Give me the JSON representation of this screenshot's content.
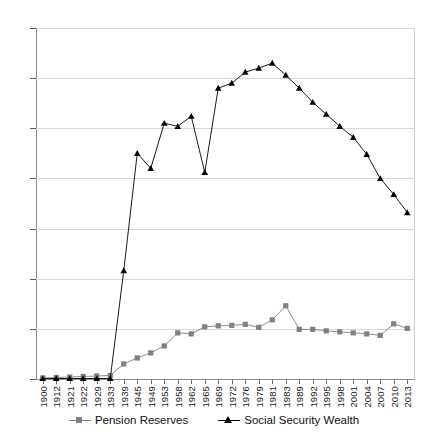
{
  "chart_data": {
    "type": "line",
    "title": "",
    "subtitle": "",
    "xlabel": "",
    "ylabel": "",
    "ylim": [
      0,
      35
    ],
    "yticks": [
      0,
      5,
      10,
      15,
      20,
      25,
      30,
      35
    ],
    "grid": true,
    "legend_position": "bottom",
    "categories": [
      "1900",
      "1912",
      "1921",
      "1922",
      "1929",
      "1933",
      "1939",
      "1945",
      "1949",
      "1953",
      "1958",
      "1962",
      "1965",
      "1969",
      "1972",
      "1976",
      "1979",
      "1981",
      "1983",
      "1989",
      "1992",
      "1995",
      "1998",
      "2001",
      "2004",
      "2007",
      "2010",
      "2013"
    ],
    "series": [
      {
        "name": "Pension Reserves",
        "marker": "square",
        "color": "#808080",
        "values": [
          0.1,
          0.15,
          0.2,
          0.25,
          0.3,
          0.35,
          1.5,
          2.1,
          2.6,
          3.3,
          4.6,
          4.5,
          5.2,
          5.3,
          5.35,
          5.45,
          5.15,
          5.9,
          7.3,
          4.95,
          4.95,
          4.8,
          4.7,
          4.6,
          4.5,
          4.35,
          5.5,
          5.05
        ]
      },
      {
        "name": "Social Security Wealth",
        "marker": "triangle",
        "color": "#000000",
        "values": [
          0.05,
          0.05,
          0.05,
          0.05,
          0.05,
          0.05,
          10.8,
          22.5,
          21.0,
          25.5,
          25.2,
          26.2,
          20.6,
          29.0,
          29.5,
          30.6,
          31.0,
          31.5,
          30.3,
          29.0,
          27.6,
          26.4,
          25.2,
          24.1,
          22.4,
          20.0,
          18.4,
          16.6
        ]
      }
    ]
  },
  "legend": {
    "entries": [
      {
        "label": "Pension Reserves"
      },
      {
        "label": "Social Security Wealth"
      }
    ]
  }
}
